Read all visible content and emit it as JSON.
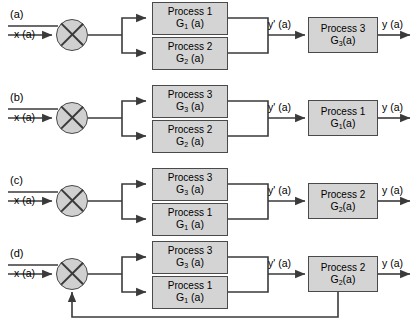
{
  "diagram": {
    "colors": {
      "box_fill": "#d4d4d4",
      "box_border": "#4a4a4a",
      "wire": "#3a3a3a",
      "background": "#ffffff"
    },
    "input_label": "x (a)",
    "intermediate_label": "y' (a)",
    "output_label": "y (a)",
    "rows": [
      {
        "tag": "(a)",
        "input": "x (a)",
        "parallel": [
          {
            "name": "Process 1",
            "gain": "G",
            "gain_sub": "1",
            "gain_arg": " (a)"
          },
          {
            "name": "Process 2",
            "gain": "G",
            "gain_sub": "2",
            "gain_arg": " (a)"
          }
        ],
        "intermediate": "y' (a)",
        "series": {
          "name": "Process 3",
          "gain": "G",
          "gain_sub": "3",
          "gain_arg": "(a)"
        },
        "output": "y (a)",
        "feedback": false
      },
      {
        "tag": "(b)",
        "input": "x (a)",
        "parallel": [
          {
            "name": "Process 3",
            "gain": "G",
            "gain_sub": "3",
            "gain_arg": " (a)"
          },
          {
            "name": "Process 2",
            "gain": "G",
            "gain_sub": "2",
            "gain_arg": " (a)"
          }
        ],
        "intermediate": "y' (a)",
        "series": {
          "name": "Process 1",
          "gain": "G",
          "gain_sub": "1",
          "gain_arg": "(a)"
        },
        "output": "y (a)",
        "feedback": false
      },
      {
        "tag": "(c)",
        "input": "x (a)",
        "parallel": [
          {
            "name": "Process 3",
            "gain": "G",
            "gain_sub": "3",
            "gain_arg": " (a)"
          },
          {
            "name": "Process 1",
            "gain": "G",
            "gain_sub": "1",
            "gain_arg": " (a)"
          }
        ],
        "intermediate": "y' (a)",
        "series": {
          "name": "Process 2",
          "gain": "G",
          "gain_sub": "2",
          "gain_arg": "(a)"
        },
        "output": "y (a)",
        "feedback": false
      },
      {
        "tag": "(d)",
        "input": "x (a)",
        "parallel": [
          {
            "name": "Process 3",
            "gain": "G",
            "gain_sub": "3",
            "gain_arg": " (a)"
          },
          {
            "name": "Process 1",
            "gain": "G",
            "gain_sub": "1",
            "gain_arg": " (a)"
          }
        ],
        "intermediate": "y' (a)",
        "series": {
          "name": "Process 2",
          "gain": "G",
          "gain_sub": "2",
          "gain_arg": "(a)"
        },
        "output": "y (a)",
        "feedback": true
      }
    ]
  }
}
